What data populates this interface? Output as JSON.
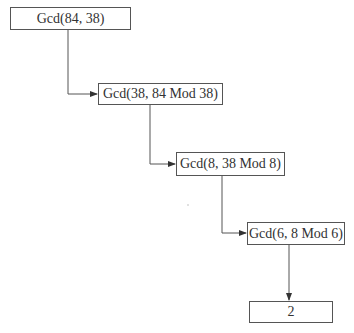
{
  "diagram": {
    "type": "flowchart",
    "title": "",
    "colors": {
      "line": "#555555",
      "text": "#333333",
      "background": "#ffffff"
    },
    "nodes": [
      {
        "id": "n1",
        "label": "Gcd(84, 38)"
      },
      {
        "id": "n2",
        "label": "Gcd(38, 84 Mod 38)"
      },
      {
        "id": "n3",
        "label": "Gcd(8, 38 Mod 8)"
      },
      {
        "id": "n4",
        "label": "Gcd(6, 8 Mod 6)"
      },
      {
        "id": "n5",
        "label": "2"
      }
    ],
    "edges": [
      {
        "from": "n1",
        "to": "n2"
      },
      {
        "from": "n2",
        "to": "n3"
      },
      {
        "from": "n3",
        "to": "n4"
      },
      {
        "from": "n4",
        "to": "n5"
      }
    ]
  }
}
